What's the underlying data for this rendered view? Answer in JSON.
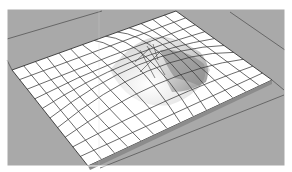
{
  "scene": {
    "description": "3D rendered grid terrain mesh with a raised hill",
    "colors": {
      "background": "#a9a9a9",
      "border": "#ffffff",
      "mesh_face": "#ffffff",
      "mesh_line": "#3a3a3a",
      "shade_dark": "#8a8a8a",
      "shade_mid": "#bdbdbd"
    },
    "mesh": {
      "grid_rows": 10,
      "grid_cols": 14,
      "corners": {
        "left": [
          12,
          70
        ],
        "top": [
          176,
          11
        ],
        "right": [
          272,
          80
        ],
        "bottom": [
          88,
          166
        ]
      }
    }
  }
}
